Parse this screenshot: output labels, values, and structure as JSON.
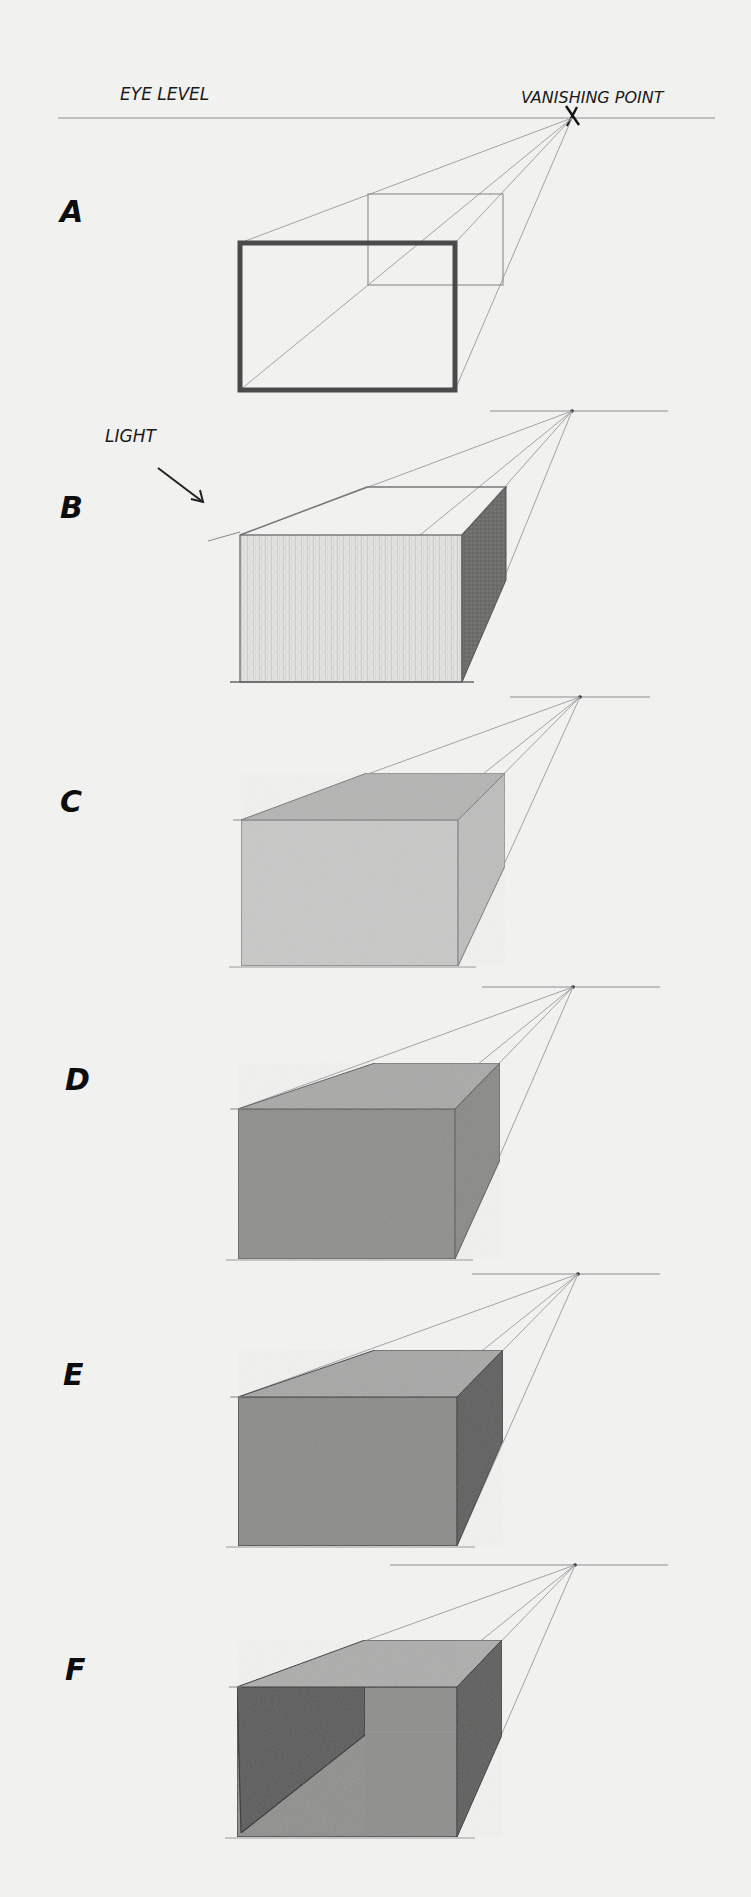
{
  "page": {
    "background": "#f1f1f0",
    "labels": {
      "eye_level": "EYE LEVEL",
      "vanishing_point": "VANISHING POINT",
      "light": "LIGHT"
    }
  },
  "eye_level_line": {
    "x1": 58,
    "x2": 715,
    "y": 118
  },
  "vanishing_point_mark": {
    "x": 572,
    "y": 118,
    "glyph": "X"
  },
  "light_arrow": {
    "x1": 158,
    "y1": 468,
    "x2": 203,
    "y2": 502
  },
  "panels": [
    {
      "id": "A",
      "label": "A",
      "label_x": 60,
      "label_y": 222,
      "vp": {
        "x": 572,
        "y": 118
      },
      "horizon": null,
      "front": {
        "x1": 240,
        "y1": 243,
        "x2": 455,
        "y2": 390
      },
      "back": {
        "x1": 368,
        "y1": 194,
        "x2": 503,
        "y2": 285
      },
      "style": "wireframe",
      "colors": {
        "front": "none",
        "top": "none",
        "side": "none",
        "outline": "#4a4a4a"
      }
    },
    {
      "id": "B",
      "label": "B",
      "label_x": 60,
      "label_y": 518,
      "vp": {
        "x": 572,
        "y": 411
      },
      "horizon": {
        "x1": 490,
        "x2": 668
      },
      "front": {
        "x1": 240,
        "y1": 535,
        "x2": 462,
        "y2": 682
      },
      "back": {
        "x1": 367,
        "y1": 487,
        "x2": 506,
        "y2": 580
      },
      "style": "hatched",
      "colors": {
        "front": "#e2e2e1",
        "top": "none",
        "side": "#6e6e6e",
        "outline": "#6a6a6a"
      }
    },
    {
      "id": "C",
      "label": "C",
      "label_x": 60,
      "label_y": 812,
      "vp": {
        "x": 580,
        "y": 697
      },
      "horizon": {
        "x1": 510,
        "x2": 650
      },
      "front": {
        "x1": 241,
        "y1": 820,
        "x2": 458,
        "y2": 966
      },
      "back": {
        "x1": 367,
        "y1": 773,
        "x2": 505,
        "y2": 866
      },
      "style": "light-tone",
      "colors": {
        "front": "#c8c8c7",
        "top": "#b4b4b3",
        "side": "#bdbdbc",
        "outline": "#7a7a7a"
      }
    },
    {
      "id": "D",
      "label": "D",
      "label_x": 65,
      "label_y": 1090,
      "vp": {
        "x": 573,
        "y": 987
      },
      "horizon": {
        "x1": 482,
        "x2": 660
      },
      "front": {
        "x1": 238,
        "y1": 1109,
        "x2": 455,
        "y2": 1259
      },
      "back": {
        "x1": 375,
        "y1": 1063,
        "x2": 500,
        "y2": 1160
      },
      "style": "mid-tone",
      "colors": {
        "front": "#8f8f8e",
        "top": "#a9a9a8",
        "side": "#8a8a89",
        "outline": "#5a5a5a"
      }
    },
    {
      "id": "E",
      "label": "E",
      "label_x": 63,
      "label_y": 1385,
      "vp": {
        "x": 578,
        "y": 1274
      },
      "horizon": {
        "x1": 472,
        "x2": 660
      },
      "front": {
        "x1": 238,
        "y1": 1397,
        "x2": 457,
        "y2": 1546
      },
      "back": {
        "x1": 375,
        "y1": 1350,
        "x2": 503,
        "y2": 1440
      },
      "style": "shaded",
      "colors": {
        "front": "#8c8c8b",
        "top": "#a7a7a6",
        "side": "#5f5f5e",
        "outline": "#3e3e3e"
      }
    },
    {
      "id": "F",
      "label": "F",
      "label_x": 65,
      "label_y": 1680,
      "vp": {
        "x": 575,
        "y": 1565
      },
      "horizon": {
        "x1": 390,
        "x2": 668
      },
      "front": {
        "x1": 237,
        "y1": 1687,
        "x2": 457,
        "y2": 1837
      },
      "back": {
        "x1": 365,
        "y1": 1640,
        "x2": 502,
        "y2": 1735
      },
      "style": "cast-shadow",
      "colors": {
        "front": "#8e8e8d",
        "top": "#adadac",
        "side": "#5e5e5d",
        "outline": "#3a3a3a",
        "inner_wall": "#5c5c5b",
        "window": "#f4f4f3"
      }
    }
  ]
}
